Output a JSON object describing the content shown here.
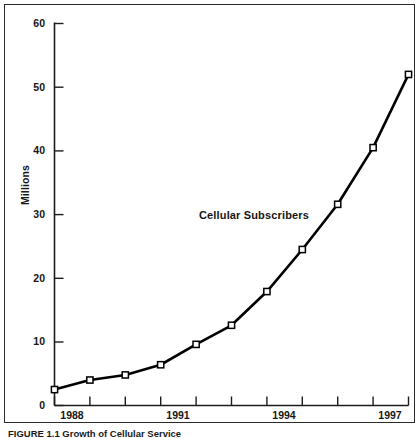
{
  "chart_data": {
    "type": "line",
    "title": "",
    "annotation": "Cellular Subscribers",
    "xlabel": "",
    "ylabel": "Millions",
    "ylim": [
      0,
      60
    ],
    "y_ticks": [
      0,
      10,
      20,
      30,
      40,
      50,
      60
    ],
    "y_tick_labels": [
      "0",
      "10",
      "20",
      "30",
      "40",
      "50",
      "60"
    ],
    "grid": false,
    "legend": "none",
    "x_tick_labels": [
      "1988",
      "",
      "",
      "1991",
      "",
      "",
      "1994",
      "",
      "",
      "1997",
      ""
    ],
    "x_tick_count": 11,
    "x_labeled_ticks": [
      "1988",
      "1991",
      "1994",
      "1997"
    ],
    "categories": [
      "1988",
      "1988.9",
      "1989.8",
      "1991",
      "1991.9",
      "1992.9",
      "1994",
      "1994.9",
      "1995.9",
      "1997",
      "1997.9"
    ],
    "series": [
      {
        "name": "Cellular Subscribers",
        "values": [
          2.5,
          4.0,
          4.8,
          6.4,
          9.6,
          12.6,
          17.9,
          24.5,
          31.6,
          40.5,
          52.0
        ],
        "marker": "open-square",
        "line_color": "#000000",
        "marker_fill": "#ffffff"
      }
    ]
  },
  "caption": {
    "text": "FIGURE 1.1   Growth of Cellular Service"
  },
  "colors": {
    "axis": "#1d1d1d",
    "line": "#000000",
    "frame": "#2b2b2b",
    "background": "#ffffff",
    "text": "#161616"
  }
}
